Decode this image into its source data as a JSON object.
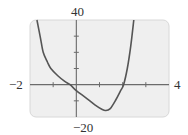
{
  "chart_data": {
    "type": "line",
    "title": "",
    "xlabel": "",
    "ylabel": "",
    "xlim": [
      -2,
      4
    ],
    "ylim": [
      -20,
      40
    ],
    "x_tick_step": 1,
    "y_tick_step": 10,
    "grid": false,
    "legend": null,
    "window_labels": {
      "x_min": "−2",
      "x_max": "4",
      "y_min": "−20",
      "y_max": "40"
    },
    "series": [
      {
        "name": "f(x)",
        "x": [
          -1.7,
          -1.55,
          -1.43,
          -1.25,
          -1.1,
          -0.8,
          -0.5,
          -0.27,
          0,
          0.4,
          0.8,
          1.1,
          1.26,
          1.45,
          1.7,
          1.9,
          2.04,
          2.2,
          2.35,
          2.48
        ],
        "y": [
          40,
          29,
          20,
          14,
          10,
          5.5,
          2,
          0,
          -3.7,
          -8,
          -12.5,
          -15.2,
          -16,
          -15,
          -9.5,
          -4,
          0,
          10,
          24,
          40
        ]
      }
    ],
    "key_points": {
      "x_intercepts": [
        -0.27,
        2.04
      ],
      "y_intercept": -3.7,
      "local_minimum": [
        1.26,
        -16
      ]
    }
  },
  "colors": {
    "plot_background": "#efefef",
    "plot_border": "#d8d8d8",
    "axis": "#6b6b6b",
    "curve": "#555555",
    "label": "#333333"
  }
}
